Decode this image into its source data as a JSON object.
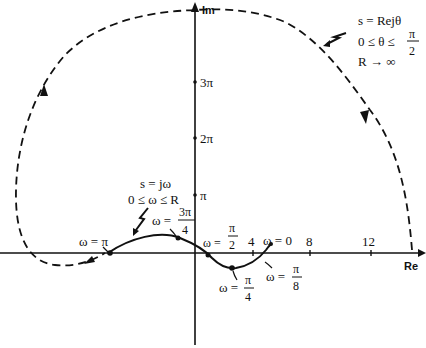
{
  "diagram": {
    "type": "nyquist-plot",
    "axes": {
      "real_label": "Re",
      "imag_label": "Im",
      "real_ticks": [
        "4",
        "8",
        "12"
      ],
      "imag_ticks": [
        "π",
        "2π",
        "3π"
      ]
    },
    "contour_label": {
      "line1": "s = Rejθ",
      "line2_prefix": "0 ≤ θ ≤",
      "line2_frac_num": "π",
      "line2_frac_den": "2",
      "line3": "R → ∞"
    },
    "jw_label": {
      "line1": "s = jω",
      "line2": "0 ≤ ω ≤ R"
    },
    "point_labels": {
      "w_pi": "ω = π",
      "w_3pi4_prefix": "ω =",
      "w_3pi4_num": "3π",
      "w_3pi4_den": "4",
      "w_pi2_prefix": "ω =",
      "w_pi2_num": "π",
      "w_pi2_den": "2",
      "w_0": "ω = 0",
      "w_pi4_prefix": "ω =",
      "w_pi4_num": "π",
      "w_pi4_den": "4",
      "w_pi8_prefix": "ω =",
      "w_pi8_num": "π",
      "w_pi8_den": "8"
    },
    "colors": {
      "ink": "#111111",
      "background": "#ffffff"
    }
  }
}
